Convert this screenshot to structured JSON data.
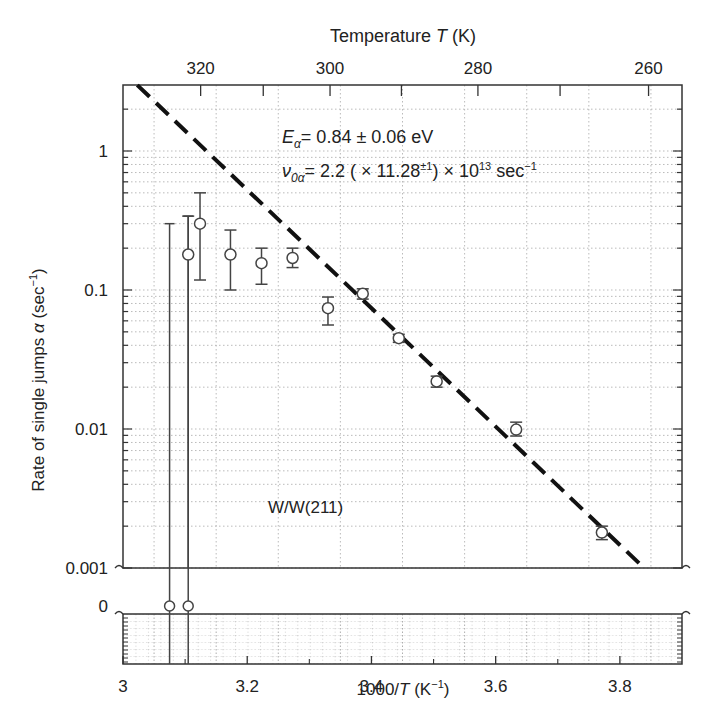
{
  "chart_data": {
    "type": "scatter",
    "title": "",
    "xlabel": "1000/T (K⁻¹)",
    "ylabel": "Rate of single jumps α (sec⁻¹)",
    "top_xlabel": "Temperature T (K)",
    "xlim": [
      3.0,
      3.9
    ],
    "ylim": [
      0.001,
      3.0
    ],
    "yscale": "log",
    "grid": true,
    "x_ticks": [
      3,
      3.2,
      3.4,
      3.6,
      3.8
    ],
    "x_tick_labels": [
      "3",
      "3.2",
      "3.4",
      "3.6",
      "3.8"
    ],
    "y_ticks": [
      1,
      0.1,
      0.01,
      0.001
    ],
    "y_tick_labels": [
      "1",
      "0.1",
      "0.01",
      "0.001"
    ],
    "zero_panel_label": "0",
    "top_ticks": [
      320,
      300,
      280,
      260
    ],
    "top_tick_labels": [
      "320",
      "300",
      "280",
      "260"
    ],
    "annotations": [
      "Eα = 0.84 ± 0.06 eV",
      "ν0α = 2.2 (× 11.28±¹) × 10¹³ sec⁻¹",
      "W/W(211)"
    ],
    "series": [
      {
        "name": "measured",
        "marker": "open-circle",
        "points": [
          {
            "x": 3.075,
            "y": 0,
            "err_hi": 0.3,
            "err_lo": 0
          },
          {
            "x": 3.105,
            "y": 0,
            "err_hi": 0.34,
            "err_lo": 0
          },
          {
            "x": 3.105,
            "y": 0.18,
            "err_hi": 0.34,
            "err_lo": 0
          },
          {
            "x": 3.124,
            "y": 0.3,
            "err_hi": 0.5,
            "err_lo": 0.118
          },
          {
            "x": 3.173,
            "y": 0.18,
            "err_hi": 0.27,
            "err_lo": 0.1
          },
          {
            "x": 3.223,
            "y": 0.156,
            "err_hi": 0.2,
            "err_lo": 0.11
          },
          {
            "x": 3.273,
            "y": 0.17,
            "err_hi": 0.2,
            "err_lo": 0.145
          },
          {
            "x": 3.33,
            "y": 0.074,
            "err_hi": 0.089,
            "err_lo": 0.056
          },
          {
            "x": 3.386,
            "y": 0.094,
            "err_hi": 0.102,
            "err_lo": 0.086
          },
          {
            "x": 3.444,
            "y": 0.045,
            "err_hi": 0.048,
            "err_lo": 0.042
          },
          {
            "x": 3.505,
            "y": 0.022,
            "err_hi": 0.024,
            "err_lo": 0.02
          },
          {
            "x": 3.633,
            "y": 0.0099,
            "err_hi": 0.0112,
            "err_lo": 0.0089
          },
          {
            "x": 3.771,
            "y": 0.0018,
            "err_hi": 0.002,
            "err_lo": 0.0016
          }
        ]
      },
      {
        "name": "Arrhenius fit",
        "style": "dashed",
        "points": [
          {
            "x": 3.023,
            "y": 2.98
          },
          {
            "x": 3.839,
            "y": 0.001
          }
        ]
      }
    ]
  }
}
